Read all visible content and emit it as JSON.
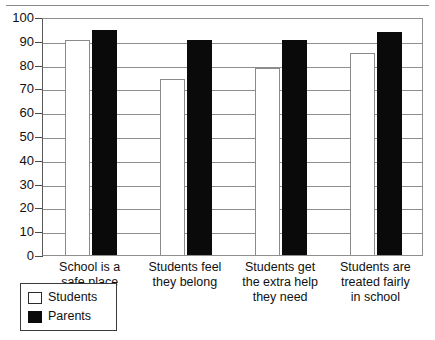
{
  "chart_data": {
    "type": "bar",
    "title": "",
    "subtitle": "",
    "xlabel": "",
    "ylabel": "",
    "ylim": [
      0,
      100
    ],
    "ytick_step": 10,
    "yticks": [
      100,
      90,
      80,
      70,
      60,
      50,
      40,
      30,
      20,
      10,
      0
    ],
    "grid": true,
    "legend_position": "bottom-left",
    "categories": [
      "School is a safe place",
      "Students feel they belong",
      "Students get the extra help they need",
      "Students are treated fairly in school"
    ],
    "category_lines": [
      [
        "School is a",
        "safe place"
      ],
      [
        "Students feel",
        "they belong"
      ],
      [
        "Students get",
        "the extra help",
        "they need"
      ],
      [
        "Students are",
        "treated fairly",
        "in school"
      ]
    ],
    "series": [
      {
        "name": "Students",
        "color": "#ffffff",
        "values": [
          90.5,
          74,
          78.5,
          85
        ]
      },
      {
        "name": "Parents",
        "color": "#000000",
        "values": [
          94.5,
          90.5,
          90.5,
          93.5
        ]
      }
    ]
  },
  "legend": {
    "items": [
      {
        "label": "Students",
        "swatch": "white-square-swatch"
      },
      {
        "label": "Parents",
        "swatch": "black-square-swatch"
      }
    ]
  },
  "colors": {
    "axis": "#4a4a4a",
    "grid": "#8e8e8e",
    "students_fill": "#ffffff",
    "parents_fill": "#0a0a0a",
    "text": "#111111"
  }
}
